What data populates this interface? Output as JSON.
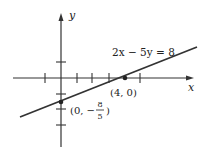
{
  "diagram": {
    "type": "line-graph",
    "equation": "2x − 5y = 8",
    "axis_x_label": "x",
    "axis_y_label": "y",
    "points": [
      {
        "label": "(4, 0)",
        "x": 4,
        "y": 0
      },
      {
        "label_prefix": "(0, −",
        "frac_num": "8",
        "frac_den": "5",
        "label_suffix": ")",
        "x": 0,
        "y": -1.6
      }
    ],
    "x_ticks": [
      -1,
      1,
      2,
      3,
      4,
      5
    ],
    "y_ticks": [
      1,
      -1,
      -3
    ]
  }
}
